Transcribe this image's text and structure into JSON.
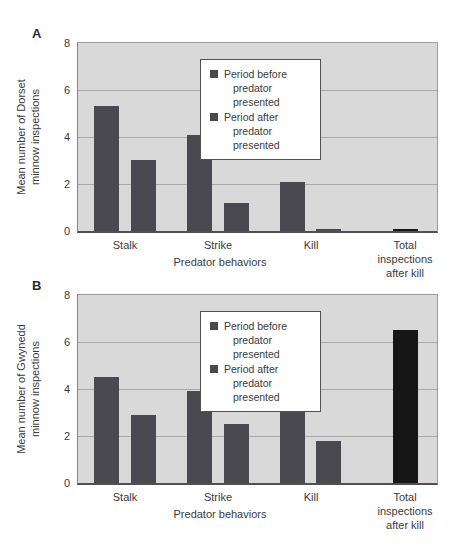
{
  "figure": {
    "background": "#ffffff",
    "text_color": "#3b3a40"
  },
  "colors": {
    "before": "#4a494f",
    "after": "#4a494f",
    "total": "#161616",
    "plot_bg": "#d9d9d9",
    "grid": "#a9a9a9",
    "plot_border": "#9c9c9c",
    "axis": "#504f55",
    "legend_border": "#55524e"
  },
  "chart_data": [
    {
      "type": "bar",
      "panel_label": "A",
      "ylabel": "Mean number of Dorset\nminnow inspections",
      "xlabel": "Predator behaviors",
      "ylim": [
        0,
        8
      ],
      "yticks": [
        0,
        2,
        4,
        6,
        8
      ],
      "gridlines": [
        2,
        4,
        6
      ],
      "grid": true,
      "legend_position": "top-center-inside",
      "categories": [
        "Stalk",
        "Strike",
        "Kill",
        "Total\ninspections\nafter kill"
      ],
      "series": [
        {
          "name": "Period before predator presented",
          "key": "before",
          "values": [
            5.3,
            4.1,
            2.1,
            null
          ]
        },
        {
          "name": "Period after predator presented",
          "key": "after",
          "values": [
            3.0,
            1.2,
            0.1,
            null
          ]
        },
        {
          "name": "Total inspections after kill",
          "key": "total",
          "values": [
            null,
            null,
            null,
            0.1
          ]
        }
      ],
      "legend": {
        "entries": [
          {
            "key": "before",
            "line1": "Period before",
            "line2": "predator presented"
          },
          {
            "key": "after",
            "line1": "Period after",
            "line2": "predator presented"
          }
        ]
      }
    },
    {
      "type": "bar",
      "panel_label": "B",
      "ylabel": "Mean number of Gwynedd\nminnow inspections",
      "xlabel": "Predator behaviors",
      "ylim": [
        0,
        8
      ],
      "yticks": [
        0,
        2,
        4,
        6,
        8
      ],
      "gridlines": [
        2,
        4,
        6
      ],
      "grid": true,
      "legend_position": "top-center-inside",
      "categories": [
        "Stalk",
        "Strike",
        "Kill",
        "Total\ninspections\nafter kill"
      ],
      "series": [
        {
          "name": "Period before predator presented",
          "key": "before",
          "values": [
            4.5,
            3.9,
            3.3,
            null
          ]
        },
        {
          "name": "Period after predator presented",
          "key": "after",
          "values": [
            2.9,
            2.5,
            1.8,
            null
          ]
        },
        {
          "name": "Total inspections after kill",
          "key": "total",
          "values": [
            null,
            null,
            null,
            6.5
          ]
        }
      ],
      "legend": {
        "entries": [
          {
            "key": "before",
            "line1": "Period before",
            "line2": "predator presented"
          },
          {
            "key": "after",
            "line1": "Period after",
            "line2": "predator presented"
          }
        ]
      }
    }
  ]
}
